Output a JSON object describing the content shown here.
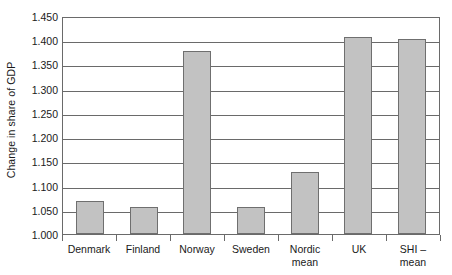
{
  "chart_data": {
    "type": "bar",
    "title": "",
    "xlabel": "",
    "ylabel": "Change in share of GDP",
    "ylim": [
      1.0,
      1.45
    ],
    "ytick_step": 0.05,
    "yticks": [
      "1.450",
      "1.400",
      "1.350",
      "1.300",
      "1.250",
      "1.200",
      "1.150",
      "1.100",
      "1.050",
      "1.000"
    ],
    "ytick_values": [
      1.45,
      1.4,
      1.35,
      1.3,
      1.25,
      1.2,
      1.15,
      1.1,
      1.05,
      1.0
    ],
    "grid": true,
    "legend": "none",
    "categories": [
      "Denmark",
      "Finland",
      "Norway",
      "Sweden",
      "Nordic mean",
      "UK",
      "SHI – mean"
    ],
    "category_lines": [
      [
        "Denmark"
      ],
      [
        "Finland"
      ],
      [
        "Norway"
      ],
      [
        "Sweden"
      ],
      [
        "Nordic",
        "mean"
      ],
      [
        "UK"
      ],
      [
        "SHI –",
        "mean"
      ]
    ],
    "values": [
      1.068,
      1.055,
      1.378,
      1.056,
      1.128,
      1.406,
      1.402
    ],
    "bar_fill": "#c2c2c2",
    "bar_border": "#6f6f6f",
    "axis_color": "#6a6a6a",
    "background": "#ffffff"
  }
}
